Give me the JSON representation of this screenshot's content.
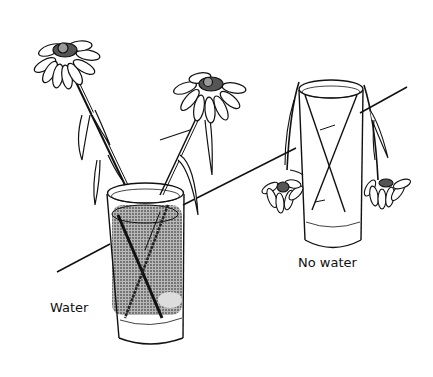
{
  "figure": {
    "labels": {
      "water": "Water",
      "no_water": "No water"
    },
    "colors": {
      "ink": "#111111",
      "water_fill": "#8a8a8a",
      "background": "#ffffff"
    }
  }
}
